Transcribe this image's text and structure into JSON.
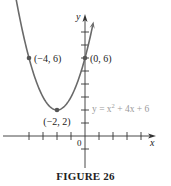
{
  "chart_data": {
    "type": "line",
    "title": "",
    "caption": "FIGURE 26",
    "xlabel": "x",
    "ylabel": "y",
    "origin_label": "0",
    "function": "y = x^2 + 4x + 6",
    "equation_label": {
      "prefix": "y = x",
      "sup": "2",
      "suffix": " + 4x + 6"
    },
    "xlim": [
      -6,
      6
    ],
    "ylim": [
      -2,
      9
    ],
    "x_ticks": [
      -4,
      -3,
      -2,
      -1,
      1,
      2,
      3,
      4
    ],
    "y_ticks": [
      -1,
      1,
      2,
      3,
      4,
      5,
      6,
      7,
      8
    ],
    "grid": false,
    "labeled_points": [
      {
        "x": -4,
        "y": 6,
        "label": "(−4, 6)"
      },
      {
        "x": 0,
        "y": 6,
        "label": "(0, 6)"
      },
      {
        "x": -2,
        "y": 2,
        "label": "(−2, 2)"
      }
    ],
    "series": [
      {
        "name": "y = x^2 + 4x + 6",
        "x": [
          -5.2,
          -4,
          -3,
          -2,
          -1,
          0,
          0.7
        ],
        "values": [
          8.24,
          6,
          3,
          2,
          3,
          6,
          9.29
        ]
      }
    ]
  },
  "colors": {
    "curve": "#6a6a6a",
    "axis": "#333333",
    "equation_text": "#9a9a9a",
    "point": "#555555",
    "text": "#222222"
  }
}
